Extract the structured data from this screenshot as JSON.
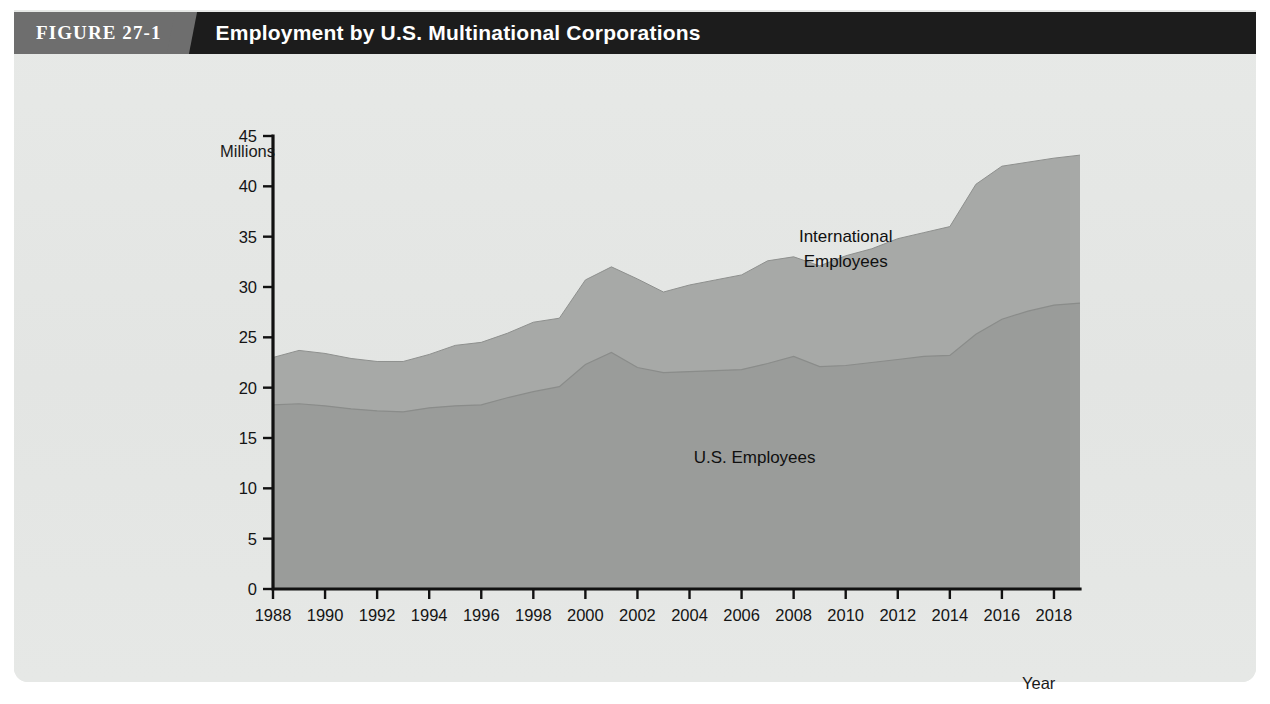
{
  "figure": {
    "badge": "FIGURE 27-1",
    "title": "Employment by U.S. Multinational Corporations"
  },
  "colors": {
    "titlebar": "#1c1c1c",
    "badge": "#6e6e6e",
    "panel": "#e5e7e5",
    "us_employees_area": "#9a9c9a",
    "international_employees_area": "#a7a9a7",
    "axis": "#111111"
  },
  "chart_data": {
    "type": "area",
    "stacked": true,
    "title": "Employment by U.S. Multinational Corporations",
    "xlabel": "Year",
    "ylabel": "Millions",
    "ylim": [
      0,
      45
    ],
    "xlim": [
      1988,
      2019
    ],
    "grid": false,
    "legend_position": "inline-annotation",
    "y_ticks": [
      0,
      5,
      10,
      15,
      20,
      25,
      30,
      35,
      40,
      45
    ],
    "x_ticks": [
      1988,
      1990,
      1992,
      1994,
      1996,
      1998,
      2000,
      2002,
      2004,
      2006,
      2008,
      2010,
      2012,
      2014,
      2016,
      2018
    ],
    "x": [
      1988,
      1989,
      1990,
      1991,
      1992,
      1993,
      1994,
      1995,
      1996,
      1997,
      1998,
      1999,
      2000,
      2001,
      2002,
      2003,
      2004,
      2005,
      2006,
      2007,
      2008,
      2009,
      2010,
      2011,
      2012,
      2013,
      2014,
      2015,
      2016,
      2017,
      2018,
      2019
    ],
    "series": [
      {
        "name": "U.S. Employees",
        "values": [
          18.3,
          18.4,
          18.2,
          17.9,
          17.7,
          17.6,
          18.0,
          18.2,
          18.3,
          19.0,
          19.6,
          20.1,
          22.3,
          23.5,
          22.0,
          21.5,
          21.6,
          21.7,
          21.8,
          22.4,
          23.1,
          22.1,
          22.2,
          22.5,
          22.8,
          23.1,
          23.2,
          25.3,
          26.8,
          27.6,
          28.2,
          28.4
        ]
      },
      {
        "name": "International Employees",
        "values": [
          4.7,
          5.3,
          5.2,
          5.0,
          4.9,
          5.0,
          5.3,
          6.0,
          6.2,
          6.4,
          6.9,
          6.8,
          8.4,
          8.5,
          8.8,
          8.0,
          8.6,
          9.0,
          9.4,
          10.2,
          9.9,
          10.0,
          10.9,
          11.3,
          12.0,
          12.3,
          12.8,
          14.9,
          15.2,
          14.8,
          14.6,
          14.7
        ]
      }
    ],
    "totals": [
      23.0,
      23.7,
      23.4,
      22.9,
      22.6,
      22.6,
      23.3,
      24.2,
      24.5,
      25.4,
      26.5,
      26.9,
      30.7,
      32.0,
      30.8,
      29.5,
      30.2,
      30.7,
      31.2,
      32.6,
      33.0,
      32.1,
      33.1,
      33.8,
      34.8,
      35.4,
      36.0,
      40.2,
      42.0,
      42.4,
      42.8,
      43.1
    ],
    "annotations": [
      {
        "text": "International Employees",
        "x": 2010,
        "y": 34.5
      },
      {
        "text": "U.S. Employees",
        "x": 2006.5,
        "y": 12.5
      }
    ]
  },
  "axis_labels": {
    "y_unit": "Millions",
    "x_unit": "Year"
  },
  "series_labels": {
    "international_line1": "International",
    "international_line2": "Employees",
    "us": "U.S. Employees"
  }
}
